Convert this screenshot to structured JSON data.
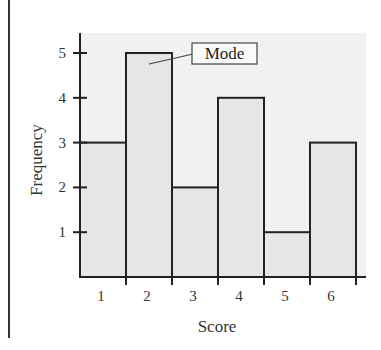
{
  "chart_data": {
    "type": "bar",
    "title": "",
    "categories": [
      "1",
      "2",
      "3",
      "4",
      "5",
      "6"
    ],
    "values": [
      3,
      5,
      2,
      4,
      1,
      3
    ],
    "xlabel": "Score",
    "ylabel": "Frequency",
    "yticks": [
      "1",
      "2",
      "3",
      "4",
      "5"
    ],
    "ylim": [
      0,
      5.5
    ],
    "grid": false,
    "legend": null,
    "annotations": [
      {
        "text": "Mode",
        "target_category": "2"
      }
    ],
    "histogram_style": true
  },
  "colors": {
    "bar_fill": "#e6e6e6",
    "plot_bg": "#f0f0f0",
    "line": "#222222"
  }
}
